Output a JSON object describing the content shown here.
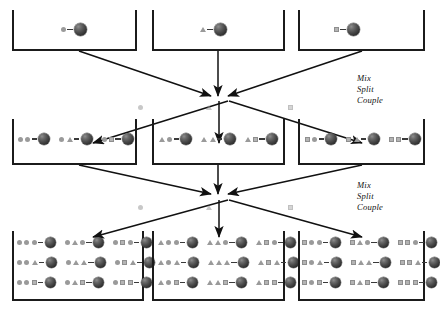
{
  "diagram": {
    "symbol_legend": {
      "circle": "circle-building-block",
      "triangle": "triangle-building-block",
      "square": "square-building-block",
      "bead": "resin-bead"
    },
    "colors": {
      "ink": "#1b1b1b",
      "symbol_gray": "#9a9a9a",
      "square_gray": "#b4b4b4",
      "bead_dark": "#2e2e2e",
      "background": "#ffffff"
    }
  },
  "steps": [
    {
      "id": "step-1",
      "lines": [
        "Mix",
        "Split",
        "Couple"
      ]
    },
    {
      "id": "step-2",
      "lines": [
        "Mix",
        "Split",
        "Couple"
      ]
    }
  ],
  "generations": [
    {
      "id": "generation-1",
      "label": "generation-1",
      "vessels": [
        {
          "id": "g1-vessel-1",
          "rows": [
            {
              "chains": [
                [
                  "circle"
                ]
              ]
            }
          ]
        },
        {
          "id": "g1-vessel-2",
          "rows": [
            {
              "chains": [
                [
                  "triangle"
                ]
              ]
            }
          ]
        },
        {
          "id": "g1-vessel-3",
          "rows": [
            {
              "chains": [
                [
                  "square"
                ]
              ]
            }
          ]
        }
      ]
    },
    {
      "id": "generation-2",
      "label": "generation-2",
      "vessels": [
        {
          "id": "g2-vessel-1",
          "rows": [
            {
              "chains": [
                [
                  "circle",
                  "circle"
                ],
                [
                  "circle",
                  "triangle"
                ],
                [
                  "circle",
                  "square"
                ]
              ]
            }
          ]
        },
        {
          "id": "g2-vessel-2",
          "rows": [
            {
              "chains": [
                [
                  "triangle",
                  "circle"
                ],
                [
                  "triangle",
                  "triangle"
                ],
                [
                  "triangle",
                  "square"
                ]
              ]
            }
          ]
        },
        {
          "id": "g2-vessel-3",
          "rows": [
            {
              "chains": [
                [
                  "square",
                  "circle"
                ],
                [
                  "square",
                  "triangle"
                ],
                [
                  "square",
                  "square"
                ]
              ]
            }
          ]
        }
      ]
    },
    {
      "id": "generation-3",
      "label": "generation-3",
      "vessels": [
        {
          "id": "g3-vessel-1",
          "rows": [
            {
              "chains": [
                [
                  "circle",
                  "circle",
                  "circle"
                ],
                [
                  "circle",
                  "triangle",
                  "circle"
                ],
                [
                  "circle",
                  "square",
                  "circle"
                ]
              ]
            },
            {
              "chains": [
                [
                  "circle",
                  "circle",
                  "triangle"
                ],
                [
                  "circle",
                  "triangle",
                  "triangle"
                ],
                [
                  "circle",
                  "square",
                  "triangle"
                ]
              ]
            },
            {
              "chains": [
                [
                  "circle",
                  "circle",
                  "square"
                ],
                [
                  "circle",
                  "triangle",
                  "square"
                ],
                [
                  "circle",
                  "square",
                  "square"
                ]
              ]
            }
          ]
        },
        {
          "id": "g3-vessel-2",
          "rows": [
            {
              "chains": [
                [
                  "triangle",
                  "circle",
                  "circle"
                ],
                [
                  "triangle",
                  "triangle",
                  "circle"
                ],
                [
                  "triangle",
                  "square",
                  "circle"
                ]
              ]
            },
            {
              "chains": [
                [
                  "triangle",
                  "circle",
                  "triangle"
                ],
                [
                  "triangle",
                  "triangle",
                  "triangle"
                ],
                [
                  "triangle",
                  "square",
                  "triangle"
                ]
              ]
            },
            {
              "chains": [
                [
                  "triangle",
                  "circle",
                  "square"
                ],
                [
                  "triangle",
                  "triangle",
                  "square"
                ],
                [
                  "triangle",
                  "square",
                  "square"
                ]
              ]
            }
          ]
        },
        {
          "id": "g3-vessel-3",
          "rows": [
            {
              "chains": [
                [
                  "square",
                  "circle",
                  "circle"
                ],
                [
                  "square",
                  "triangle",
                  "circle"
                ],
                [
                  "square",
                  "square",
                  "circle"
                ]
              ]
            },
            {
              "chains": [
                [
                  "square",
                  "circle",
                  "triangle"
                ],
                [
                  "square",
                  "triangle",
                  "triangle"
                ],
                [
                  "square",
                  "square",
                  "triangle"
                ]
              ]
            },
            {
              "chains": [
                [
                  "square",
                  "circle",
                  "square"
                ],
                [
                  "square",
                  "triangle",
                  "square"
                ],
                [
                  "square",
                  "square",
                  "square"
                ]
              ]
            }
          ]
        }
      ]
    }
  ],
  "pool_markers": [
    {
      "id": "pool-marker-1",
      "symbols": [
        "circle",
        "triangle",
        "square"
      ]
    },
    {
      "id": "pool-marker-2",
      "symbols": [
        "circle",
        "triangle",
        "square"
      ]
    }
  ]
}
